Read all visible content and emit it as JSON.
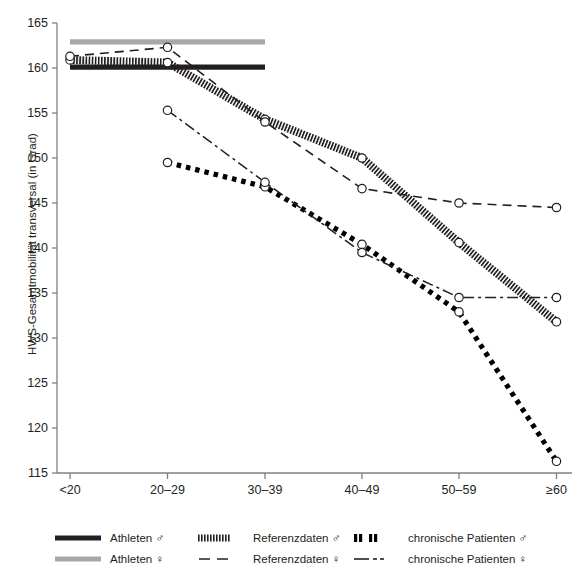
{
  "axes": {
    "ylabel": "HWS-Gesamtmobilität transversal (in Grad)",
    "xlabel": "",
    "yticks": [
      "115",
      "120",
      "125",
      "130",
      "135",
      "140",
      "145",
      "150",
      "155",
      "160",
      "165"
    ],
    "xticks": [
      "<20",
      "20–29",
      "30–39",
      "40–49",
      "50–59",
      "≥60"
    ]
  },
  "legend": {
    "items": [
      {
        "id": "athleten-m",
        "label": "Athleten ♂",
        "symbol": "solid-thick-black",
        "color": "#231f20"
      },
      {
        "id": "referenzdaten-m",
        "label": "Referenzdaten ♂",
        "symbol": "dense-hatch-black",
        "color": "#231f20"
      },
      {
        "id": "chronische-m",
        "label": "chronische Patienten ♂",
        "symbol": "thick-dotted-black",
        "color": "#000000"
      },
      {
        "id": "athleten-w",
        "label": "Athleten ♀",
        "symbol": "solid-thick-grey",
        "color": "#a8a8a8"
      },
      {
        "id": "referenzdaten-w",
        "label": "Referenzdaten ♀",
        "symbol": "dashed-black",
        "color": "#231f20"
      },
      {
        "id": "chronische-w",
        "label": "chronische Patienten ♀",
        "symbol": "dash-dot-black",
        "color": "#231f20"
      }
    ]
  },
  "chart_data": {
    "type": "line",
    "title": "",
    "xlabel": "",
    "ylabel": "HWS-Gesamtmobilität transversal (in Grad)",
    "categories": [
      "<20",
      "20–29",
      "30–39",
      "40–49",
      "50–59",
      "≥60"
    ],
    "ylim": [
      115,
      165
    ],
    "yticks": [
      115,
      120,
      125,
      130,
      135,
      140,
      145,
      150,
      155,
      160,
      165
    ],
    "grid": false,
    "legend_position": "below",
    "series": [
      {
        "name": "Athleten ♂",
        "style": "solid-thick",
        "color": "#231f20",
        "markers": false,
        "x": [
          "<20",
          "20–29",
          "30–39"
        ],
        "values": [
          160.1,
          160.1,
          160.1
        ]
      },
      {
        "name": "Athleten ♀",
        "style": "solid-thick",
        "color": "#a8a8a8",
        "markers": false,
        "x": [
          "<20",
          "20–29",
          "30–39"
        ],
        "values": [
          162.9,
          162.9,
          162.9
        ]
      },
      {
        "name": "Referenzdaten ♂",
        "style": "dense-hatch",
        "color": "#231f20",
        "markers": true,
        "x": [
          "<20",
          "20–29",
          "30–39",
          "40–49",
          "50–59",
          "≥60"
        ],
        "values": [
          160.9,
          160.6,
          154.3,
          150.0,
          140.6,
          131.8
        ]
      },
      {
        "name": "Referenzdaten ♀",
        "style": "dashed",
        "color": "#231f20",
        "markers": true,
        "x": [
          "<20",
          "20–29",
          "30–39",
          "40–49",
          "50–59",
          "≥60"
        ],
        "values": [
          161.3,
          162.3,
          154.0,
          146.6,
          145.0,
          144.5
        ]
      },
      {
        "name": "chronische Patienten ♂",
        "style": "thick-dotted",
        "color": "#000000",
        "markers": true,
        "x": [
          "20–29",
          "30–39",
          "40–49",
          "50–59",
          "≥60"
        ],
        "values": [
          149.5,
          146.8,
          140.4,
          132.9,
          116.3
        ]
      },
      {
        "name": "chronische Patienten ♀",
        "style": "dash-dot",
        "color": "#231f20",
        "markers": true,
        "x": [
          "20–29",
          "30–39",
          "40–49",
          "50–59",
          "≥60"
        ],
        "values": [
          155.3,
          147.3,
          139.5,
          134.5,
          134.5
        ]
      }
    ]
  }
}
